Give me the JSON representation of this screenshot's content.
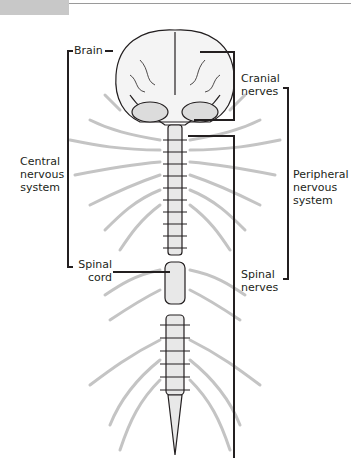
{
  "figure": {
    "header_tab": "",
    "labels": {
      "brain": "Brain",
      "cns_line1": "Central",
      "cns_line2": "nervous",
      "cns_line3": "system",
      "spinal_cord_line1": "Spinal",
      "spinal_cord_line2": "cord",
      "cranial_line1": "Cranial",
      "cranial_line2": "nerves",
      "pns_line1": "Peripheral",
      "pns_line2": "nervous",
      "pns_line3": "system",
      "spinal_nerves_line1": "Spinal",
      "spinal_nerves_line2": "nerves"
    },
    "colors": {
      "line": "#231f20",
      "nerve_gray": "#c4c4c4",
      "tab_gray": "#c8c8c8"
    }
  }
}
